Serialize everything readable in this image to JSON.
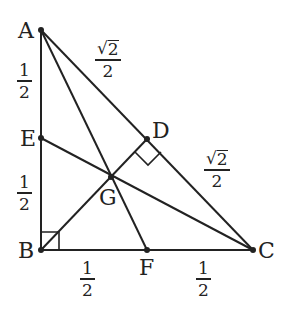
{
  "diagram": {
    "type": "geometry",
    "points": {
      "A": {
        "label": "A",
        "x": 41,
        "y": 30
      },
      "B": {
        "label": "B",
        "x": 41,
        "y": 250
      },
      "C": {
        "label": "C",
        "x": 253,
        "y": 250
      },
      "D": {
        "label": "D",
        "x": 147,
        "y": 139
      },
      "E": {
        "label": "E",
        "x": 41,
        "y": 138
      },
      "F": {
        "label": "F",
        "x": 147,
        "y": 250
      },
      "G": {
        "label": "G",
        "x": 111,
        "y": 177
      }
    },
    "segments": [
      "AB",
      "BC",
      "CA",
      "AF",
      "CE",
      "BD"
    ],
    "right_angles": [
      "B",
      "D"
    ],
    "measures": {
      "AE": {
        "num": "1",
        "den": "2"
      },
      "EB": {
        "num": "1",
        "den": "2"
      },
      "BF": {
        "num": "1",
        "den": "2"
      },
      "FC": {
        "num": "1",
        "den": "2"
      },
      "AD": {
        "sqrt": "√",
        "radicand": "2",
        "den": "2"
      },
      "DC": {
        "sqrt": "√",
        "radicand": "2",
        "den": "2"
      }
    },
    "stroke_color": "#222222"
  }
}
